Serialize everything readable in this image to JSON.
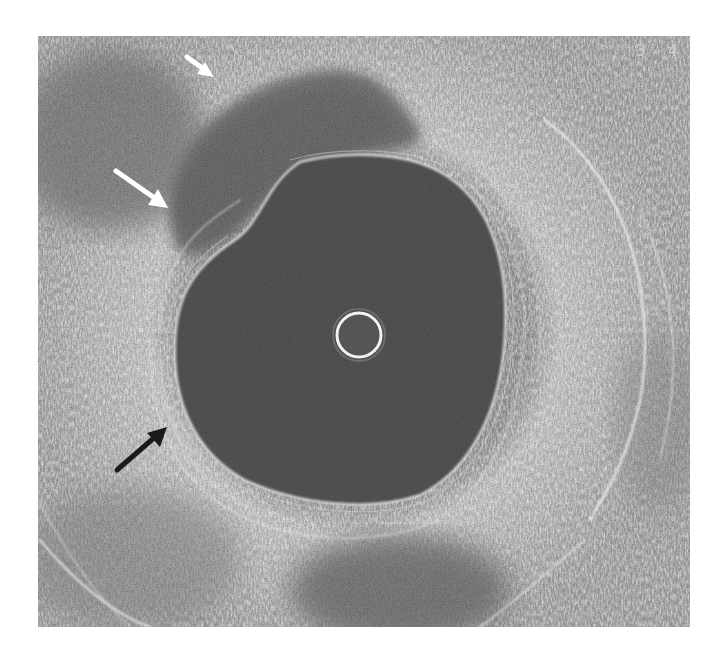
{
  "image": {
    "type": "intravascular ultrasound cross-section",
    "frame": {
      "left": 38,
      "top": 36,
      "width": 652,
      "height": 591
    },
    "colors": {
      "background": "#ffffff",
      "tissue_base": "#8e8e8e",
      "tissue_bright": "#e6e6e6",
      "lumen": "#4c4c4c",
      "plaque": "#6e6e6e",
      "catheter_ring": "#f2f2f2",
      "white_arrow": "#ffffff",
      "black_arrow": "#1a1a1a"
    },
    "catheter": {
      "cx": 359,
      "cy": 335,
      "r": 22
    },
    "lumen_bounds": {
      "left": 175,
      "right": 505,
      "top": 158,
      "bottom": 503
    }
  },
  "annotations": {
    "scale_marks": [
      "3",
      "4"
    ],
    "arrows": [
      {
        "name": "white-arrow-upper",
        "color": "white",
        "tail": [
          187,
          57
        ],
        "head": [
          213,
          76
        ]
      },
      {
        "name": "white-arrow-middle",
        "color": "white",
        "tail": [
          116,
          171
        ],
        "head": [
          167,
          207
        ]
      },
      {
        "name": "black-arrow-lower",
        "color": "black",
        "tail": [
          117,
          470
        ],
        "head": [
          166,
          428
        ]
      }
    ]
  }
}
